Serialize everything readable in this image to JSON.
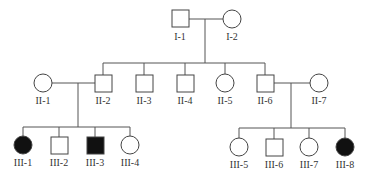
{
  "diagram": {
    "type": "pedigree",
    "colors": {
      "affected": "#111111",
      "unaffected": "#ffffff",
      "line": "#555555"
    },
    "individuals": [
      {
        "id": "I-1",
        "label": "I-1",
        "sex": "male",
        "affected": false
      },
      {
        "id": "I-2",
        "label": "I-2",
        "sex": "female",
        "affected": false
      },
      {
        "id": "II-1",
        "label": "II-1",
        "sex": "female",
        "affected": false
      },
      {
        "id": "II-2",
        "label": "II-2",
        "sex": "male",
        "affected": false
      },
      {
        "id": "II-3",
        "label": "II-3",
        "sex": "male",
        "affected": false
      },
      {
        "id": "II-4",
        "label": "II-4",
        "sex": "male",
        "affected": false
      },
      {
        "id": "II-5",
        "label": "II-5",
        "sex": "female",
        "affected": false
      },
      {
        "id": "II-6",
        "label": "II-6",
        "sex": "male",
        "affected": false
      },
      {
        "id": "II-7",
        "label": "II-7",
        "sex": "female",
        "affected": false
      },
      {
        "id": "III-1",
        "label": "III-1",
        "sex": "female",
        "affected": true
      },
      {
        "id": "III-2",
        "label": "III-2",
        "sex": "male",
        "affected": false
      },
      {
        "id": "III-3",
        "label": "III-3",
        "sex": "male",
        "affected": true
      },
      {
        "id": "III-4",
        "label": "III-4",
        "sex": "female",
        "affected": false
      },
      {
        "id": "III-5",
        "label": "III-5",
        "sex": "female",
        "affected": false
      },
      {
        "id": "III-6",
        "label": "III-6",
        "sex": "male",
        "affected": false
      },
      {
        "id": "III-7",
        "label": "III-7",
        "sex": "female",
        "affected": false
      },
      {
        "id": "III-8",
        "label": "III-8",
        "sex": "female",
        "affected": true
      }
    ],
    "labels": {
      "I1": "I-1",
      "I2": "I-2",
      "II1": "II-1",
      "II2": "II-2",
      "II3": "II-3",
      "II4": "II-4",
      "II5": "II-5",
      "II6": "II-6",
      "II7": "II-7",
      "III1": "III-1",
      "III2": "III-2",
      "III3": "III-3",
      "III4": "III-4",
      "III5": "III-5",
      "III6": "III-6",
      "III7": "III-7",
      "III8": "III-8"
    },
    "couples": [
      {
        "partners": [
          "I-1",
          "I-2"
        ],
        "children": [
          "II-2",
          "II-3",
          "II-4",
          "II-5",
          "II-6"
        ]
      },
      {
        "partners": [
          "II-1",
          "II-2"
        ],
        "children": [
          "III-1",
          "III-2",
          "III-3",
          "III-4"
        ]
      },
      {
        "partners": [
          "II-6",
          "II-7"
        ],
        "children": [
          "III-5",
          "III-6",
          "III-7",
          "III-8"
        ]
      }
    ]
  }
}
